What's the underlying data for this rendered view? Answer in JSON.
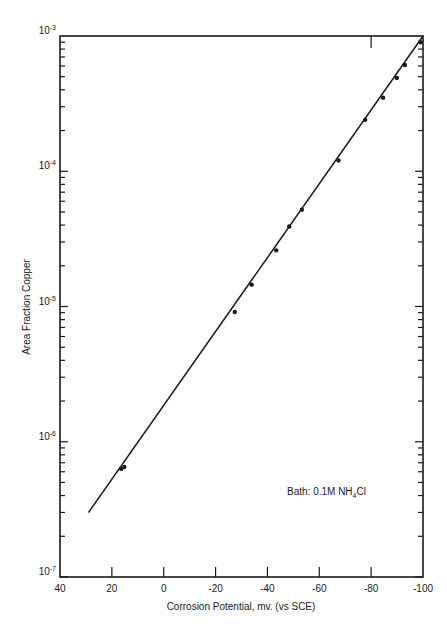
{
  "chart_data": {
    "type": "scatter",
    "title": "",
    "xlabel": "Corrosion Potential, mv. (vs SCE)",
    "ylabel": "Area Fraction Copper",
    "x_axis": {
      "ticks": [
        40,
        20,
        0,
        -20,
        -40,
        -60,
        -80,
        -100
      ],
      "tick_labels": [
        "40",
        "20",
        "0",
        "-20",
        "-40",
        "-60",
        "-80",
        "-100"
      ],
      "range": [
        40,
        -100
      ],
      "reversed": true
    },
    "y_axis": {
      "scale": "log",
      "range": [
        1e-07,
        0.001
      ],
      "decade_labels": [
        {
          "base": "10",
          "exp": "-3",
          "value": 0.001
        },
        {
          "base": "10",
          "exp": "-4",
          "value": 0.0001
        },
        {
          "base": "10",
          "exp": "-5",
          "value": 1e-05
        },
        {
          "base": "10",
          "exp": "-6",
          "value": 1e-06
        },
        {
          "base": "10",
          "exp": "-7",
          "value": 1e-07
        }
      ]
    },
    "grid": false,
    "series": [
      {
        "name": "measured",
        "style": "points",
        "points": [
          {
            "x": 16.4,
            "y": 6.3e-07
          },
          {
            "x": 15.2,
            "y": 6.5e-07
          },
          {
            "x": -27.4,
            "y": 9.1e-06
          },
          {
            "x": -33.9,
            "y": 1.45e-05
          },
          {
            "x": -43.4,
            "y": 2.6e-05
          },
          {
            "x": -48.4,
            "y": 3.9e-05
          },
          {
            "x": -53.3,
            "y": 5.2e-05
          },
          {
            "x": -67.4,
            "y": 0.00012
          },
          {
            "x": -77.7,
            "y": 0.00024
          },
          {
            "x": -84.6,
            "y": 0.00035
          },
          {
            "x": -89.9,
            "y": 0.00049
          },
          {
            "x": -93.0,
            "y": 0.00061
          },
          {
            "x": -99.0,
            "y": 0.0009
          }
        ]
      },
      {
        "name": "fit",
        "style": "line",
        "points": [
          {
            "x": 29,
            "y": 3e-07
          },
          {
            "x": -100,
            "y": 0.001
          }
        ]
      }
    ],
    "annotations": [
      {
        "text_prefix": "Bath: 0.1M NH",
        "subscript": "4",
        "text_suffix": "Cl"
      }
    ],
    "legend": null
  },
  "labels": {
    "xlabel": "Corrosion Potential, mv. (vs SCE)",
    "ylabel": "Area Fraction Copper",
    "annotation_prefix": "Bath: 0.1M NH",
    "annotation_sub": "4",
    "annotation_suffix": "Cl"
  },
  "colors": {
    "ink": "#1a1a1a",
    "background": "#ffffff"
  }
}
